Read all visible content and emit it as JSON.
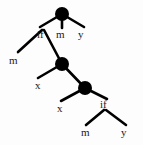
{
  "figure": {
    "type": "syntax-tree-diagram",
    "colors": {
      "node_fill": "#000000",
      "edge_stroke": "#000000",
      "label_text": "#1a1a1a",
      "background": "#fdfdfd"
    },
    "nodes": [
      {
        "id": "n1",
        "x": 62,
        "y": 14,
        "r": 7
      },
      {
        "id": "n2",
        "x": 62,
        "y": 64,
        "r": 7
      },
      {
        "id": "n3",
        "x": 85,
        "y": 88,
        "r": 7
      }
    ],
    "edges": [
      {
        "from_x": 62,
        "from_y": 14,
        "to_x": 40,
        "to_y": 27,
        "name": "n1-left"
      },
      {
        "from_x": 62,
        "from_y": 14,
        "to_x": 62,
        "to_y": 28,
        "name": "n1-middle"
      },
      {
        "from_x": 62,
        "from_y": 14,
        "to_x": 84,
        "to_y": 27,
        "name": "n1-right"
      },
      {
        "from_x": 42,
        "from_y": 30,
        "to_x": 18,
        "to_y": 52,
        "name": "if1-left"
      },
      {
        "from_x": 44,
        "from_y": 30,
        "to_x": 62,
        "to_y": 64,
        "name": "if1-right"
      },
      {
        "from_x": 62,
        "from_y": 64,
        "to_x": 38,
        "to_y": 78,
        "name": "n2-left"
      },
      {
        "from_x": 62,
        "from_y": 64,
        "to_x": 85,
        "to_y": 88,
        "name": "n2-right"
      },
      {
        "from_x": 85,
        "from_y": 88,
        "to_x": 61,
        "to_y": 101,
        "name": "n3-left"
      },
      {
        "from_x": 85,
        "from_y": 88,
        "to_x": 107,
        "to_y": 99,
        "name": "n3-right"
      },
      {
        "from_x": 104,
        "from_y": 110,
        "to_x": 86,
        "to_y": 125,
        "name": "if2-left"
      },
      {
        "from_x": 106,
        "from_y": 110,
        "to_x": 126,
        "to_y": 125,
        "name": "if2-right"
      }
    ],
    "labels": [
      {
        "id": "lbl-if-1",
        "text": "if",
        "x": 37,
        "y": 29
      },
      {
        "id": "lbl-m-1",
        "text": "m",
        "x": 56,
        "y": 29
      },
      {
        "id": "lbl-y-1",
        "text": "y",
        "x": 78,
        "y": 29
      },
      {
        "id": "lbl-m-2",
        "text": "m",
        "x": 9,
        "y": 55
      },
      {
        "id": "lbl-x-1",
        "text": "x",
        "x": 35,
        "y": 80
      },
      {
        "id": "lbl-x-2",
        "text": "x",
        "x": 57,
        "y": 103
      },
      {
        "id": "lbl-if-2",
        "text": "if",
        "x": 100,
        "y": 99
      },
      {
        "id": "lbl-m-3",
        "text": "m",
        "x": 81,
        "y": 127
      },
      {
        "id": "lbl-y-2",
        "text": "y",
        "x": 121,
        "y": 127
      }
    ]
  }
}
